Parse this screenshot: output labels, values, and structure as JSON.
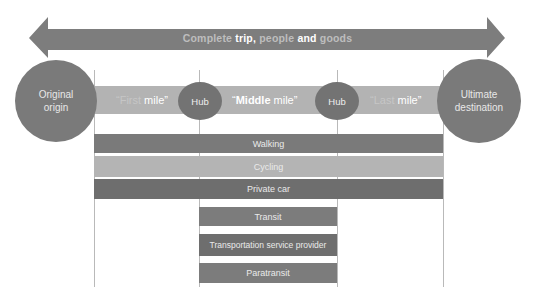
{
  "colors": {
    "arrow": "#7d7d7d",
    "circle": "#7a7a7a",
    "hub": "#737373",
    "mile_band": "#b3b3b3",
    "walking": "#7a7a7a",
    "cycling": "#b4b4b4",
    "private_car": "#6e6e6e",
    "transit": "#7c7c7c",
    "tsp": "#6e6e6e",
    "paratransit": "#7c7c7c",
    "guide_line": "#b9b9b9"
  },
  "arrow": {
    "words": [
      {
        "text": "Complete",
        "style": "dim"
      },
      {
        "text": " trip,",
        "style": "bright"
      },
      {
        "text": " people",
        "style": "dim"
      },
      {
        "text": " and",
        "style": "bright"
      },
      {
        "text": " goods",
        "style": "dim"
      }
    ]
  },
  "endpoints": {
    "origin": {
      "line1": "Original",
      "line2": "origin"
    },
    "destination": {
      "line1": "Ultimate",
      "line2": "destination"
    }
  },
  "miles": {
    "first": {
      "open_quote": "“",
      "word": "First",
      "rest": " mile”"
    },
    "middle": {
      "open_quote": "“",
      "word": "Middle",
      "rest": " mile”"
    },
    "last": {
      "open_quote": "“",
      "word": "Last",
      "rest": " mile”"
    },
    "hubs": [
      "Hub",
      "Hub"
    ]
  },
  "modes": {
    "full_span": [
      "Walking",
      "Cycling",
      "Private car"
    ],
    "middle_span": [
      "Transit",
      "Transportation service provider",
      "Paratransit"
    ]
  }
}
